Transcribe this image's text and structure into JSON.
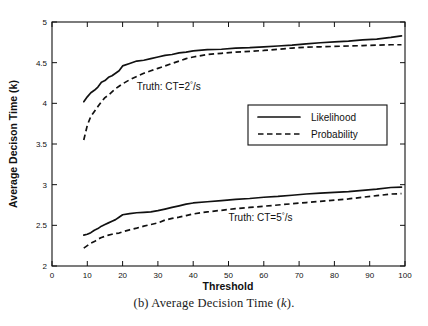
{
  "caption": {
    "prefix": "(b) Average Decision Time (",
    "symbol": "k",
    "suffix": ")."
  },
  "chart_data": {
    "type": "line",
    "title": "",
    "xlabel": "Threshold",
    "ylabel": "Average Decison Time (k)",
    "xlim": [
      0,
      100
    ],
    "ylim": [
      2,
      5
    ],
    "xticks": [
      0,
      10,
      20,
      30,
      40,
      50,
      60,
      70,
      80,
      90,
      100
    ],
    "xticklabels": [
      "0",
      "10",
      "20",
      "30",
      "40",
      "50",
      "60",
      "70",
      "80",
      "90",
      "100"
    ],
    "yticks": [
      2,
      2.5,
      3,
      3.5,
      4,
      4.5,
      5
    ],
    "yticklabels": [
      "2",
      "2.5",
      "3",
      "3.5",
      "4",
      "4.5",
      "5"
    ],
    "grid": false,
    "legend_position": "center-right-upper",
    "legend": [
      {
        "name": "Likelihood",
        "style": "solid"
      },
      {
        "name": "Probability",
        "style": "dashed"
      }
    ],
    "annotations": [
      {
        "text_prefix": "Truth: CT=2",
        "superscript": "°",
        "text_suffix": "/s",
        "x": 24,
        "y": 4.16,
        "group": "upper"
      },
      {
        "text_prefix": "Truth: CT=5",
        "superscript": "°",
        "text_suffix": "/s",
        "x": 50,
        "y": 2.55,
        "group": "lower"
      }
    ],
    "x": [
      9,
      10,
      11,
      12,
      13,
      14,
      15,
      16,
      17,
      18,
      19,
      20,
      22,
      24,
      26,
      28,
      30,
      32,
      34,
      36,
      38,
      40,
      44,
      48,
      52,
      56,
      60,
      64,
      68,
      72,
      76,
      80,
      84,
      88,
      92,
      96,
      99
    ],
    "series": [
      {
        "name": "Likelihood (CT=2°/s)",
        "style": "solid",
        "group": "upper",
        "values": [
          4.02,
          4.08,
          4.13,
          4.16,
          4.2,
          4.26,
          4.28,
          4.32,
          4.34,
          4.37,
          4.4,
          4.46,
          4.49,
          4.52,
          4.53,
          4.55,
          4.57,
          4.59,
          4.6,
          4.62,
          4.63,
          4.645,
          4.66,
          4.665,
          4.68,
          4.685,
          4.695,
          4.705,
          4.715,
          4.73,
          4.745,
          4.755,
          4.765,
          4.78,
          4.79,
          4.81,
          4.83
        ]
      },
      {
        "name": "Probability (CT=2°/s)",
        "style": "dashed",
        "group": "upper",
        "values": [
          3.55,
          3.73,
          3.84,
          3.9,
          3.96,
          4.02,
          4.07,
          4.1,
          4.14,
          4.18,
          4.21,
          4.24,
          4.29,
          4.33,
          4.37,
          4.4,
          4.43,
          4.46,
          4.49,
          4.52,
          4.55,
          4.57,
          4.6,
          4.615,
          4.63,
          4.64,
          4.65,
          4.665,
          4.68,
          4.69,
          4.695,
          4.7,
          4.705,
          4.71,
          4.715,
          4.72,
          4.72
        ]
      },
      {
        "name": "Likelihood (CT=5°/s)",
        "style": "solid",
        "group": "lower",
        "values": [
          2.38,
          2.39,
          2.41,
          2.44,
          2.46,
          2.49,
          2.51,
          2.53,
          2.55,
          2.57,
          2.6,
          2.63,
          2.645,
          2.655,
          2.66,
          2.665,
          2.68,
          2.7,
          2.72,
          2.74,
          2.76,
          2.775,
          2.79,
          2.805,
          2.82,
          2.83,
          2.845,
          2.855,
          2.87,
          2.885,
          2.895,
          2.905,
          2.915,
          2.93,
          2.945,
          2.965,
          2.97
        ]
      },
      {
        "name": "Probability (CT=5°/s)",
        "style": "dashed",
        "group": "lower",
        "values": [
          2.22,
          2.25,
          2.28,
          2.3,
          2.33,
          2.35,
          2.365,
          2.38,
          2.39,
          2.4,
          2.405,
          2.42,
          2.445,
          2.465,
          2.49,
          2.51,
          2.53,
          2.565,
          2.585,
          2.6,
          2.62,
          2.64,
          2.665,
          2.685,
          2.705,
          2.72,
          2.735,
          2.75,
          2.765,
          2.78,
          2.795,
          2.81,
          2.825,
          2.845,
          2.865,
          2.885,
          2.89
        ]
      }
    ]
  }
}
